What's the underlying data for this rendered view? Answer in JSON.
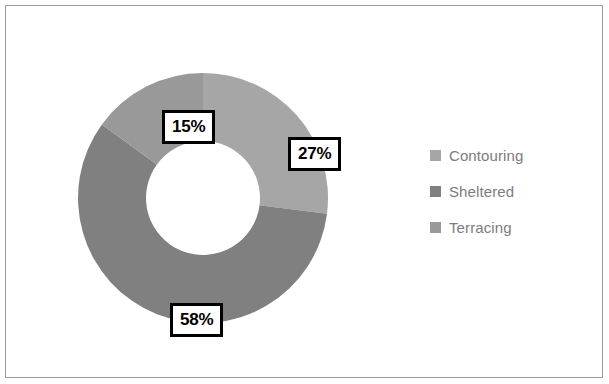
{
  "chart_data": {
    "type": "pie",
    "variant": "donut",
    "title": "",
    "categories": [
      "Contouring",
      "Sheltered",
      "Terracing"
    ],
    "values": [
      27,
      58,
      15
    ],
    "value_unit": "%",
    "data_labels": [
      "27%",
      "58%",
      "15%"
    ],
    "colors": [
      "#a6a6a6",
      "#808080",
      "#999999"
    ],
    "legend": {
      "position": "right",
      "entries": [
        {
          "label": "Contouring",
          "color": "#a6a6a6"
        },
        {
          "label": "Sheltered",
          "color": "#808080"
        },
        {
          "label": "Terracing",
          "color": "#999999"
        }
      ]
    },
    "geometry": {
      "center_x": 202,
      "center_y": 197,
      "outer_radius": 125,
      "inner_radius": 57,
      "start_angle_deg": 0,
      "direction": "clockwise",
      "slice_angles_deg": [
        {
          "name": "Contouring",
          "start": 0,
          "end": 97.2
        },
        {
          "name": "Sheltered",
          "start": 97.2,
          "end": 306.0
        },
        {
          "name": "Terracing",
          "start": 306.0,
          "end": 360.0
        }
      ]
    },
    "grid": false,
    "xlabel": "",
    "ylabel": ""
  },
  "frame": {
    "border_color": "#9a9a9a",
    "background": "#ffffff"
  },
  "labels": {
    "style": {
      "text_color": "#000000",
      "fill": "#ffffff",
      "border_color": "#000000"
    }
  }
}
